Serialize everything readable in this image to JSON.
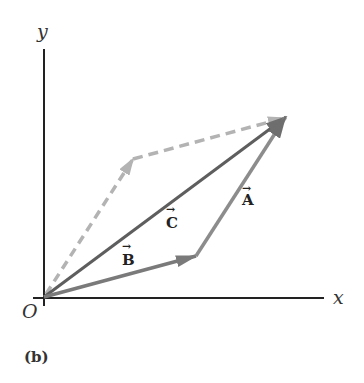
{
  "figure": {
    "caption": "(b)",
    "origin_label": "O",
    "x_axis_label": "x",
    "y_axis_label": "y"
  },
  "vectors": {
    "A": {
      "label": "A",
      "arrow": "→",
      "color": "#8c8c8c"
    },
    "B": {
      "label": "B",
      "arrow": "→",
      "color": "#7a7a7a"
    },
    "C": {
      "label": "C",
      "arrow": "→",
      "color": "#5e5e5e"
    },
    "A_dashed": {
      "color": "#b3b3b3"
    },
    "B_dashed": {
      "color": "#b3b3b3"
    }
  }
}
